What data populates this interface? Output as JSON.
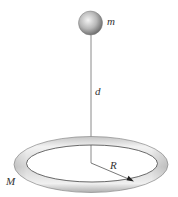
{
  "diagram": {
    "type": "physics-ring-and-point-mass",
    "labels": {
      "mass_point": "m",
      "distance": "d",
      "radius": "R",
      "ring_mass": "M"
    },
    "colors": {
      "background": "#ffffff",
      "line": "#888888",
      "radius_line": "#555555",
      "label": "#333333",
      "sphere_light": "#f2f2f2",
      "sphere_dark": "#6e6e6e",
      "ring_light": "#f4f4f4",
      "ring_dark": "#8a8a8a"
    }
  }
}
